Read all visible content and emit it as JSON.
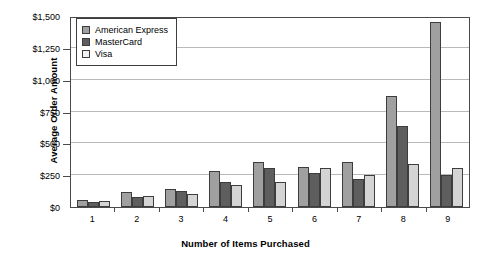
{
  "chart_data": {
    "type": "bar",
    "title": "",
    "xlabel": "Number of Items Purchased",
    "ylabel": "Average Order Amount",
    "categories": [
      "1",
      "2",
      "3",
      "4",
      "5",
      "6",
      "7",
      "8",
      "9"
    ],
    "series": [
      {
        "name": "American Express",
        "values": [
          55,
          120,
          145,
          285,
          350,
          315,
          350,
          875,
          1450
        ],
        "color": "#a0a0a0"
      },
      {
        "name": "MasterCard",
        "values": [
          40,
          80,
          125,
          200,
          310,
          270,
          220,
          640,
          255
        ],
        "color": "#5e5e5e"
      },
      {
        "name": "Visa",
        "values": [
          50,
          90,
          105,
          175,
          200,
          305,
          255,
          340,
          305
        ],
        "color": "#d4d4d4"
      }
    ],
    "ylim": [
      0,
      1500
    ],
    "ytick_values": [
      0,
      250,
      500,
      750,
      1000,
      1250,
      1500
    ],
    "ytick_labels": [
      "$0",
      "$250",
      "$500",
      "$750",
      "$1,000",
      "$1,250",
      "$1,500"
    ],
    "grid": true,
    "legend_position": "top-left",
    "orientation": "vertical",
    "grouping": "clustered"
  },
  "legend": {
    "items": [
      {
        "label": "American Express",
        "swatch": "amex"
      },
      {
        "label": "MasterCard",
        "swatch": "mc"
      },
      {
        "label": "Visa",
        "swatch": "visa"
      }
    ]
  },
  "colors": {
    "american_express": "#a0a0a0",
    "mastercard": "#5e5e5e",
    "visa": "#d4d4d4",
    "gridline": "#b9b9b9",
    "axis": "#4a4a4a",
    "text": "#000000",
    "background": "#ffffff"
  }
}
